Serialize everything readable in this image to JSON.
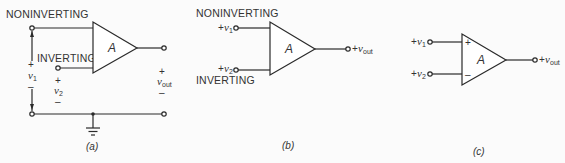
{
  "figure": {
    "panels": [
      {
        "id": "a",
        "caption": "(a)",
        "amplifier_label": "A",
        "noninverting_label": "NONINVERTING",
        "inverting_label": "INVERTING",
        "v1": {
          "plus": "+",
          "symbol": "v",
          "sub": "1",
          "minus": "–"
        },
        "v2": {
          "plus": "+",
          "symbol": "v",
          "sub": "2",
          "minus": "–"
        },
        "vout": {
          "plus": "+",
          "symbol": "v",
          "sub": "out",
          "minus": "–"
        },
        "ground": "ground-symbol"
      },
      {
        "id": "b",
        "caption": "(b)",
        "amplifier_label": "A",
        "noninverting_label": "NONINVERTING",
        "inverting_label": "INVERTING",
        "v1": {
          "prefix": "+",
          "symbol": "v",
          "sub": "1"
        },
        "v2": {
          "prefix": "+",
          "symbol": "v",
          "sub": "2"
        },
        "vout": {
          "prefix": "+",
          "symbol": "v",
          "sub": "out"
        }
      },
      {
        "id": "c",
        "caption": "(c)",
        "amplifier_label": "A",
        "plus_input_mark": "+",
        "minus_input_mark": "–",
        "v1": {
          "prefix": "+",
          "symbol": "v",
          "sub": "1"
        },
        "v2": {
          "prefix": "+",
          "symbol": "v",
          "sub": "2"
        },
        "vout": {
          "prefix": "+",
          "symbol": "v",
          "sub": "out"
        }
      }
    ]
  }
}
